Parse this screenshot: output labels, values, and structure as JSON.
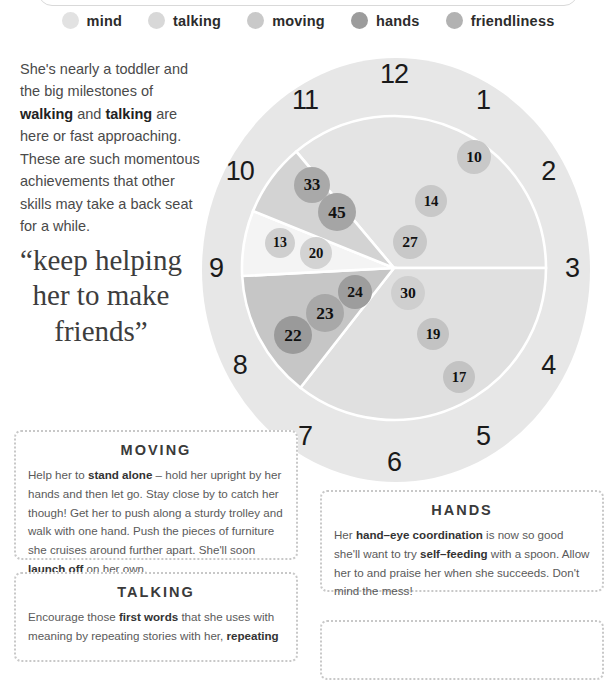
{
  "legend": {
    "items": [
      {
        "label": "mind",
        "color": "#e2e2e2",
        "icon": "circle-swatch-icon"
      },
      {
        "label": "talking",
        "color": "#d8d8d8",
        "icon": "circle-swatch-icon"
      },
      {
        "label": "moving",
        "color": "#c9c9c9",
        "icon": "circle-swatch-icon"
      },
      {
        "label": "hands",
        "color": "#9c9c9c",
        "icon": "circle-swatch-icon"
      },
      {
        "label": "friendliness",
        "color": "#b2b2b2",
        "icon": "circle-swatch-icon"
      }
    ]
  },
  "intro": {
    "line1": "She's nearly a toddler and the big",
    "line2_pre": "milestones of ",
    "line2_bold": "walking",
    "line2_post": " and",
    "line3_bold": "talking",
    "line3_post": " are here or fast",
    "line4": "approaching. These are such",
    "line5": "momentous achievements",
    "line6": "that other skills",
    "line7": "may take a back",
    "line8": "seat for a while."
  },
  "quote": {
    "text": "“keep helping her to make friends”"
  },
  "clock": {
    "numbers": [
      "12",
      "1",
      "2",
      "3",
      "4",
      "5",
      "6",
      "7",
      "8",
      "9",
      "10",
      "11"
    ],
    "face_color": "#e7e7e7"
  },
  "chart_data": {
    "type": "pie",
    "center_note": "Values are milestone numbers plotted as bubbles inside each skill wedge",
    "legend_position": "top",
    "categories": [
      "mind",
      "talking",
      "moving",
      "hands",
      "friendliness"
    ],
    "slices": [
      {
        "name": "mind",
        "color": "#e4e4e4",
        "start_deg": 320,
        "end_deg": 90,
        "sweep_deg": 130,
        "bubbles": [
          10,
          14,
          27
        ]
      },
      {
        "name": "talking",
        "color": "#e0e0e0",
        "start_deg": 90,
        "end_deg": 218,
        "sweep_deg": 128,
        "bubbles": [
          30,
          19,
          17
        ]
      },
      {
        "name": "friendliness",
        "color": "#c6c6c6",
        "start_deg": 218,
        "end_deg": 267,
        "sweep_deg": 49,
        "bubbles": [
          22,
          23,
          24
        ]
      },
      {
        "name": "white-gap",
        "color": "#f4f4f4",
        "start_deg": 267,
        "end_deg": 292,
        "sweep_deg": 25,
        "bubbles": [
          13,
          20
        ]
      },
      {
        "name": "moving",
        "color": "#d3d3d3",
        "start_deg": 292,
        "end_deg": 320,
        "sweep_deg": 28,
        "bubbles": [
          33,
          45
        ]
      }
    ],
    "bubbles": [
      {
        "value": 10,
        "color": "#c8c8c8",
        "r": 17,
        "cx": 474,
        "cy": 157
      },
      {
        "value": 14,
        "color": "#c8c8c8",
        "r": 16,
        "cx": 431,
        "cy": 201
      },
      {
        "value": 27,
        "color": "#c8c8c8",
        "r": 17,
        "cx": 410,
        "cy": 242
      },
      {
        "value": 30,
        "color": "#cfcfcf",
        "r": 17,
        "cx": 408,
        "cy": 293
      },
      {
        "value": 19,
        "color": "#c3c3c3",
        "r": 16,
        "cx": 433,
        "cy": 334
      },
      {
        "value": 17,
        "color": "#c3c3c3",
        "r": 16,
        "cx": 459,
        "cy": 377
      },
      {
        "value": 24,
        "color": "#9d9d9d",
        "r": 17,
        "cx": 355,
        "cy": 292
      },
      {
        "value": 23,
        "color": "#a8a8a8",
        "r": 19,
        "cx": 325,
        "cy": 313
      },
      {
        "value": 22,
        "color": "#9a9a9a",
        "r": 19,
        "cx": 293,
        "cy": 335
      },
      {
        "value": 13,
        "color": "#cfcfcf",
        "r": 15,
        "cx": 280,
        "cy": 243
      },
      {
        "value": 20,
        "color": "#d3d3d3",
        "r": 16,
        "cx": 316,
        "cy": 253
      },
      {
        "value": 33,
        "color": "#a9a9a9",
        "r": 18,
        "cx": 312,
        "cy": 185
      },
      {
        "value": 45,
        "color": "#a5a5a5",
        "r": 19,
        "cx": 337,
        "cy": 212
      }
    ]
  },
  "boxes": {
    "moving": {
      "title": "MOVING",
      "p1": "Help her to ",
      "b1": "stand alone",
      "p2": " – hold her upright by her hands and then let go. Stay close by to catch her though! Get her to push along a sturdy trolley and walk with one hand. Push the pieces of furniture she cruises around further apart. She'll soon ",
      "b2": "launch off",
      "p3": " on her own."
    },
    "talking": {
      "title": "TALKING",
      "p1": "Encourage those ",
      "b1": "first words",
      "p2": " that she uses with meaning by repeating stories with her, ",
      "b2": "repeating"
    },
    "hands": {
      "title": "HANDS",
      "p1": "Her ",
      "b1": "hand–eye coordination",
      "p2": " is now so good she'll want to try ",
      "b2": "self–feeding",
      "p3": " with a spoon. Allow her to and praise her when she succeeds. Don't mind the mess!"
    }
  }
}
